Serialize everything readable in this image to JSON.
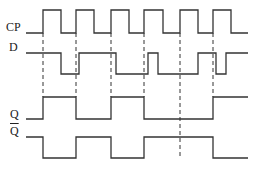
{
  "diagram": {
    "type": "timing-diagram",
    "signals": [
      {
        "name": "CP",
        "label": "CP",
        "label_pos": [
          6,
          27
        ],
        "high_y": 10,
        "low_y": 33,
        "points": [
          [
            26,
            33
          ],
          [
            43,
            33
          ],
          [
            43,
            10
          ],
          [
            61,
            10
          ],
          [
            61,
            33
          ],
          [
            76,
            33
          ],
          [
            76,
            10
          ],
          [
            94,
            10
          ],
          [
            94,
            33
          ],
          [
            111,
            33
          ],
          [
            111,
            10
          ],
          [
            129,
            10
          ],
          [
            129,
            33
          ],
          [
            144,
            33
          ],
          [
            144,
            10
          ],
          [
            163,
            10
          ],
          [
            163,
            33
          ],
          [
            180,
            33
          ],
          [
            180,
            10
          ],
          [
            198,
            10
          ],
          [
            198,
            33
          ],
          [
            213,
            33
          ],
          [
            213,
            10
          ],
          [
            231,
            10
          ],
          [
            231,
            33
          ],
          [
            248,
            33
          ]
        ]
      },
      {
        "name": "D",
        "label": "D",
        "label_pos": [
          9,
          47
        ],
        "high_y": 53,
        "low_y": 74,
        "points": [
          [
            26,
            53
          ],
          [
            61,
            53
          ],
          [
            61,
            74
          ],
          [
            79,
            74
          ],
          [
            79,
            53
          ],
          [
            116,
            53
          ],
          [
            116,
            74
          ],
          [
            148,
            74
          ],
          [
            148,
            53
          ],
          [
            158,
            53
          ],
          [
            158,
            74
          ],
          [
            198,
            74
          ],
          [
            198,
            53
          ],
          [
            216,
            53
          ],
          [
            216,
            74
          ],
          [
            226,
            74
          ],
          [
            226,
            53
          ],
          [
            248,
            53
          ]
        ]
      },
      {
        "name": "Q",
        "label": "Q",
        "label_pos": [
          10,
          114
        ],
        "high_y": 97,
        "low_y": 119,
        "points": [
          [
            26,
            119
          ],
          [
            43,
            119
          ],
          [
            43,
            97
          ],
          [
            76,
            97
          ],
          [
            76,
            119
          ],
          [
            111,
            119
          ],
          [
            111,
            97
          ],
          [
            144,
            97
          ],
          [
            144,
            119
          ],
          [
            213,
            119
          ],
          [
            213,
            97
          ],
          [
            248,
            97
          ]
        ]
      },
      {
        "name": "Q_bar",
        "label": "Q",
        "label_overline": true,
        "label_pos": [
          10,
          131
        ],
        "high_y": 137,
        "low_y": 158,
        "points": [
          [
            26,
            137
          ],
          [
            43,
            137
          ],
          [
            43,
            158
          ],
          [
            76,
            158
          ],
          [
            76,
            137
          ],
          [
            111,
            137
          ],
          [
            111,
            158
          ],
          [
            144,
            158
          ],
          [
            144,
            137
          ],
          [
            213,
            137
          ],
          [
            213,
            158
          ],
          [
            248,
            158
          ]
        ]
      }
    ],
    "dashed_guides": [
      {
        "x": 43,
        "y1": 33,
        "y2": 97
      },
      {
        "x": 76,
        "y1": 33,
        "y2": 97
      },
      {
        "x": 111,
        "y1": 33,
        "y2": 97
      },
      {
        "x": 144,
        "y1": 33,
        "y2": 97
      },
      {
        "x": 180,
        "y1": 33,
        "y2": 158
      },
      {
        "x": 213,
        "y1": 33,
        "y2": 97
      }
    ],
    "colors": {
      "line": "#333333",
      "background": "#ffffff",
      "label": "#222222"
    }
  }
}
